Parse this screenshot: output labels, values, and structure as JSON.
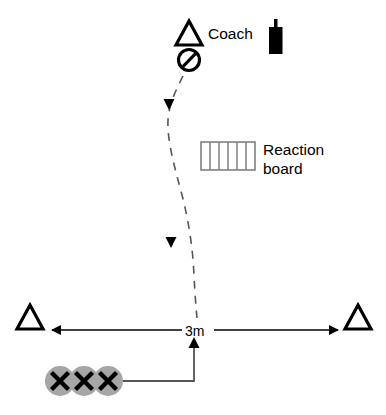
{
  "diagram": {
    "background_color": "#ffffff",
    "stroke_color": "#000000",
    "cone_color": "#000000",
    "player_fill_color": "#a6a6a6",
    "board_stroke_color": "#808080",
    "dashed_path_color": "#555555"
  },
  "labels": {
    "coach": "Coach",
    "reaction_board_line1": "Reaction",
    "reaction_board_line2": "board",
    "distance": "3m"
  },
  "icons": {
    "coach_cone": "triangle-cone-icon",
    "no_entry": "prohibition-circle-icon",
    "stopwatch": "stopwatch-icon",
    "left_cone": "triangle-cone-icon",
    "right_cone": "triangle-cone-icon",
    "player_marks": [
      "x-player-icon",
      "x-player-icon",
      "x-player-icon"
    ]
  },
  "elements": {
    "reaction_board_cells": 6,
    "players_count": 3,
    "dashed_path_arrowheads": 2,
    "distance_arrows": [
      "arrow-left",
      "arrow-right"
    ],
    "approach_arrow": "arrow-up"
  }
}
